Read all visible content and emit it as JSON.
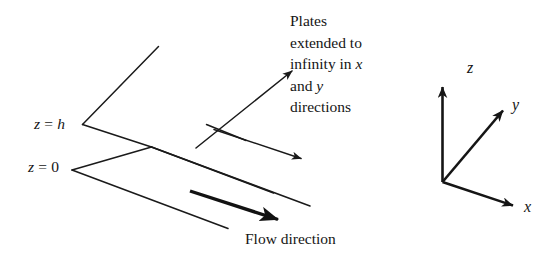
{
  "figure": {
    "stroke_color": "#1a1a1a",
    "background_color": "#ffffff"
  },
  "boundary_labels": {
    "top_plate": {
      "var": "z",
      "eq": "=",
      "value": "h",
      "full": "z = h"
    },
    "bottom_plate": {
      "var": "z",
      "eq": "=",
      "value": "0",
      "full": "z = 0"
    }
  },
  "flow": {
    "caption": "Flow direction"
  },
  "annotation": {
    "line1": "Plates",
    "line2": "extended to",
    "line3_pre": "infinity in ",
    "line3_var": "x",
    "line4_pre": "and ",
    "line4_var": "y",
    "line5": "directions",
    "full_text": "Plates extended to infinity in x and y directions"
  },
  "axes": {
    "z_label": "z",
    "y_label": "y",
    "x_label": "x",
    "origin": {
      "x": 442,
      "y": 182
    }
  }
}
